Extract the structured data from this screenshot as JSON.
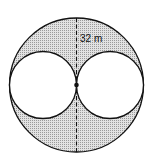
{
  "diagram": {
    "type": "geometry",
    "outer_circle": {
      "cx": 76.5,
      "cy": 85,
      "r": 67
    },
    "inner_circles": [
      {
        "cx": 43,
        "cy": 85,
        "r": 33.5
      },
      {
        "cx": 110,
        "cy": 85,
        "r": 33.5
      }
    ],
    "center_point": {
      "cx": 76.5,
      "cy": 85
    },
    "dimension_label": "32 m",
    "colors": {
      "stroke": "#111111",
      "shade": "#d4d4d4",
      "background": "#ffffff"
    }
  }
}
